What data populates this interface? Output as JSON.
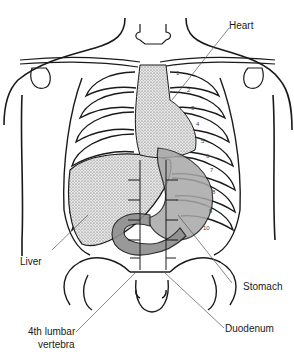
{
  "diagram": {
    "labels": {
      "heart": "Heart",
      "liver": "Liver",
      "stomach": "Stomach",
      "duodenum": "Duodenum",
      "lumbar_line1": "4th lumbar",
      "lumbar_line2": "vertebra"
    },
    "rib_numbers": [
      "1",
      "2",
      "3",
      "4",
      "5",
      "6",
      "7",
      "8",
      "9",
      "10"
    ],
    "colors": {
      "line": "#1a1a1a",
      "leader": "#555555",
      "heart_fill": "#cfcfcf",
      "liver_fill": "#d9d9d9",
      "stomach_fill": "#a8a8a8",
      "duodenum_fill": "#8f8f8f",
      "background": "#ffffff"
    }
  }
}
